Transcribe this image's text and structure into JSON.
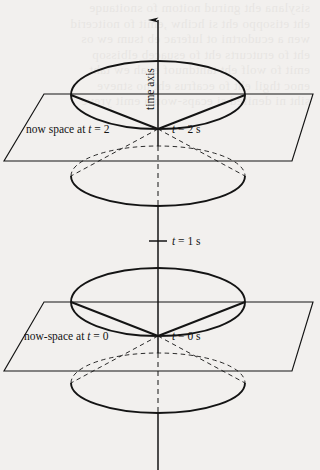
{
  "figure": {
    "background_color": "#f2f0ee",
    "ink_color": "#141414",
    "axis": {
      "name": "time axis",
      "label": "time axis",
      "orientation": "vertical",
      "arrow": "up",
      "x": 158,
      "top_y": 8,
      "bottom_y": 470
    },
    "labels": {
      "time_axis": "time axis",
      "now_space_t2": "now space at t = 2",
      "event_t2": "t = 2 s",
      "tick_t1": "t = 1 s",
      "now_space_t0": "now-space at t = 0",
      "event_t0": "t = 0 s"
    },
    "label_parts": {
      "now_space_t2_prefix": "now space at ",
      "now_space_t2_var": "t",
      "now_space_t2_value": " = 2",
      "now_space_t0_prefix": "now-space at ",
      "now_space_t0_var": "t",
      "now_space_t0_value": " = 0",
      "event_t2_var": "t",
      "event_t2_value": " = 2 s",
      "event_t0_var": "t",
      "event_t0_value": " = 0 s",
      "tick_t1_var": "t",
      "tick_t1_value": " = 1 s"
    },
    "light_cones": [
      {
        "name": "light-cone-at-t-2",
        "apex_t": 2,
        "apex_x": 158,
        "apex_y": 129,
        "future_cone_rim_cy": 95,
        "future_cone_rim_rx": 87,
        "future_cone_rim_ry": 34,
        "past_cone_rim_cy": 176,
        "past_cone_rim_rx": 87,
        "past_cone_rim_ry": 30,
        "past_cone_style": "dashed-above-plane"
      },
      {
        "name": "light-cone-at-t-0",
        "apex_t": 0,
        "apex_x": 158,
        "apex_y": 336,
        "future_cone_rim_cy": 302,
        "future_cone_rim_rx": 87,
        "future_cone_rim_ry": 34,
        "past_cone_rim_cy": 383,
        "past_cone_rim_rx": 87,
        "past_cone_rim_ry": 30,
        "past_cone_style": "dashed-above-plane"
      }
    ],
    "now_space_planes": [
      {
        "name": "now-space-plane-t-2",
        "label": "now space at t = 2",
        "top_y": 94,
        "bottom_y": 161,
        "top_left_x": 44,
        "top_right_x": 313,
        "bottom_left_x": 4,
        "bottom_right_x": 292
      },
      {
        "name": "now-space-plane-t-0",
        "label": "now-space at t = 0",
        "top_y": 302,
        "bottom_y": 371,
        "top_left_x": 44,
        "top_right_x": 313,
        "bottom_left_x": 4,
        "bottom_right_x": 292
      }
    ],
    "tick_marks": [
      {
        "name": "tick-t-1",
        "label": "t = 1 s",
        "x": 158,
        "y": 241,
        "half_width": 9
      }
    ]
  }
}
